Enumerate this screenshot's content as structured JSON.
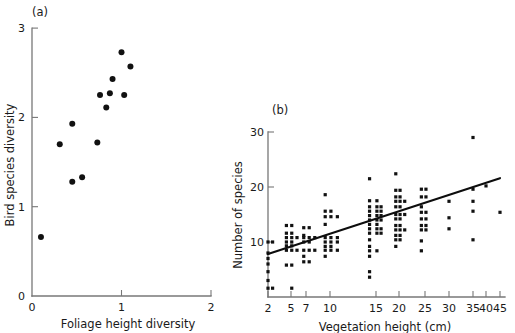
{
  "figure": {
    "panel_a_label": "(a)",
    "panel_b_label": "(b)"
  },
  "chart_data": [
    {
      "type": "scatter",
      "panel": "(a)",
      "title": "",
      "xlabel": "Foliage height diversity",
      "ylabel": "Bird species diversity",
      "xlim": [
        0,
        2
      ],
      "ylim": [
        0,
        3
      ],
      "xticks": [
        0,
        1,
        2
      ],
      "xticklabels": [
        "0",
        "1",
        "2"
      ],
      "yticks": [
        0,
        1,
        2,
        3
      ],
      "yticklabels": [
        "0",
        "1",
        "2",
        "3"
      ],
      "grid": false,
      "legend": false,
      "marker": "filled-circle",
      "points": [
        {
          "x": 0.1,
          "y": 0.66
        },
        {
          "x": 0.31,
          "y": 1.7
        },
        {
          "x": 0.45,
          "y": 1.28
        },
        {
          "x": 0.45,
          "y": 1.93
        },
        {
          "x": 0.56,
          "y": 1.33
        },
        {
          "x": 0.73,
          "y": 1.72
        },
        {
          "x": 0.76,
          "y": 2.25
        },
        {
          "x": 0.83,
          "y": 2.11
        },
        {
          "x": 0.87,
          "y": 2.27
        },
        {
          "x": 0.9,
          "y": 2.43
        },
        {
          "x": 1.0,
          "y": 2.73
        },
        {
          "x": 1.03,
          "y": 2.25
        },
        {
          "x": 1.1,
          "y": 2.57
        }
      ]
    },
    {
      "type": "scatter",
      "panel": "(b)",
      "title": "",
      "xlabel": "Vegetation height (cm)",
      "ylabel": "Number of species",
      "xlim": [
        1,
        46
      ],
      "ylim": [
        0,
        32
      ],
      "xticks": [
        2,
        5,
        7,
        10,
        15,
        20,
        25,
        30,
        35,
        40,
        45
      ],
      "xticklabels": [
        "2",
        "5",
        "7",
        "10",
        "15",
        "20",
        "25",
        "30",
        "35",
        "40",
        "45"
      ],
      "yticks": [
        10,
        20,
        30
      ],
      "yticklabels": [
        "10",
        "20",
        "30"
      ],
      "grid": false,
      "legend": false,
      "marker": "filled-square-small",
      "trendline": {
        "x1": 2,
        "y1": 7.8,
        "x2": 45,
        "y2": 21.6
      },
      "points": [
        {
          "x": 2,
          "y": 10
        },
        {
          "x": 2.6,
          "y": 10
        },
        {
          "x": 2,
          "y": 8
        },
        {
          "x": 2,
          "y": 7
        },
        {
          "x": 2,
          "y": 6
        },
        {
          "x": 2,
          "y": 4.6
        },
        {
          "x": 2,
          "y": 3
        },
        {
          "x": 2,
          "y": 1.6
        },
        {
          "x": 2.6,
          "y": 1.6
        },
        {
          "x": 4.4,
          "y": 13
        },
        {
          "x": 5.1,
          "y": 13
        },
        {
          "x": 4.4,
          "y": 11.6
        },
        {
          "x": 5.1,
          "y": 11.6
        },
        {
          "x": 4.4,
          "y": 10.8
        },
        {
          "x": 5.1,
          "y": 10.8
        },
        {
          "x": 5.8,
          "y": 10.8
        },
        {
          "x": 4.4,
          "y": 10
        },
        {
          "x": 5.1,
          "y": 10
        },
        {
          "x": 4.4,
          "y": 9.3
        },
        {
          "x": 5.1,
          "y": 9.3
        },
        {
          "x": 4.4,
          "y": 8.5
        },
        {
          "x": 5.1,
          "y": 8.5
        },
        {
          "x": 5.8,
          "y": 8.5
        },
        {
          "x": 4.4,
          "y": 5.8
        },
        {
          "x": 5.1,
          "y": 5.8
        },
        {
          "x": 5.1,
          "y": 1.6
        },
        {
          "x": 6.7,
          "y": 12.6
        },
        {
          "x": 7.4,
          "y": 12.6
        },
        {
          "x": 6.7,
          "y": 11.2
        },
        {
          "x": 6.7,
          "y": 10.8
        },
        {
          "x": 7.4,
          "y": 10.8
        },
        {
          "x": 8.1,
          "y": 10.8
        },
        {
          "x": 6.7,
          "y": 10
        },
        {
          "x": 7.4,
          "y": 10
        },
        {
          "x": 6.7,
          "y": 8.5
        },
        {
          "x": 7.4,
          "y": 8.5
        },
        {
          "x": 8.1,
          "y": 8.5
        },
        {
          "x": 6.7,
          "y": 7.4
        },
        {
          "x": 6.7,
          "y": 6.4
        },
        {
          "x": 7.4,
          "y": 6.4
        },
        {
          "x": 9.4,
          "y": 18.6
        },
        {
          "x": 9.4,
          "y": 15.6
        },
        {
          "x": 10.1,
          "y": 15.6
        },
        {
          "x": 9.4,
          "y": 14.6
        },
        {
          "x": 10.1,
          "y": 14.6
        },
        {
          "x": 10.8,
          "y": 14.6
        },
        {
          "x": 9.4,
          "y": 13.2
        },
        {
          "x": 9.4,
          "y": 10.8
        },
        {
          "x": 10.1,
          "y": 10.8
        },
        {
          "x": 10.8,
          "y": 10.8
        },
        {
          "x": 9.4,
          "y": 10
        },
        {
          "x": 10.1,
          "y": 10
        },
        {
          "x": 10.8,
          "y": 10
        },
        {
          "x": 9.4,
          "y": 9.2
        },
        {
          "x": 10.1,
          "y": 9.2
        },
        {
          "x": 9.4,
          "y": 8.5
        },
        {
          "x": 10.1,
          "y": 8.5
        },
        {
          "x": 10.8,
          "y": 8.5
        },
        {
          "x": 9.4,
          "y": 7.4
        },
        {
          "x": 14.3,
          "y": 21.5
        },
        {
          "x": 14.3,
          "y": 17.5
        },
        {
          "x": 15.2,
          "y": 17.5
        },
        {
          "x": 14.3,
          "y": 16.4
        },
        {
          "x": 15.2,
          "y": 16.4
        },
        {
          "x": 16.1,
          "y": 16.4
        },
        {
          "x": 14.3,
          "y": 15.6
        },
        {
          "x": 15.2,
          "y": 15.6
        },
        {
          "x": 16.1,
          "y": 15.6
        },
        {
          "x": 14.3,
          "y": 14.8
        },
        {
          "x": 15.2,
          "y": 14.8
        },
        {
          "x": 16.1,
          "y": 14.8
        },
        {
          "x": 14.3,
          "y": 14
        },
        {
          "x": 15.2,
          "y": 14
        },
        {
          "x": 16.1,
          "y": 14
        },
        {
          "x": 14.3,
          "y": 13.2
        },
        {
          "x": 15.2,
          "y": 13.2
        },
        {
          "x": 14.3,
          "y": 12.4
        },
        {
          "x": 15.2,
          "y": 12.4
        },
        {
          "x": 16.1,
          "y": 12.4
        },
        {
          "x": 14.3,
          "y": 11.6
        },
        {
          "x": 15.2,
          "y": 11.6
        },
        {
          "x": 16.1,
          "y": 11.6
        },
        {
          "x": 14.3,
          "y": 10.4
        },
        {
          "x": 14.3,
          "y": 9.2
        },
        {
          "x": 14.3,
          "y": 8.4
        },
        {
          "x": 15.2,
          "y": 8.4
        },
        {
          "x": 14.3,
          "y": 7.4
        },
        {
          "x": 14.3,
          "y": 4.6
        },
        {
          "x": 14.3,
          "y": 3.6
        },
        {
          "x": 19.3,
          "y": 22.4
        },
        {
          "x": 19.3,
          "y": 19.4
        },
        {
          "x": 20.2,
          "y": 19.4
        },
        {
          "x": 19.3,
          "y": 18.2
        },
        {
          "x": 20.2,
          "y": 18.2
        },
        {
          "x": 19.3,
          "y": 17.4
        },
        {
          "x": 20.2,
          "y": 17.4
        },
        {
          "x": 21.1,
          "y": 17.4
        },
        {
          "x": 19.3,
          "y": 16.4
        },
        {
          "x": 20.2,
          "y": 16.4
        },
        {
          "x": 19.3,
          "y": 15
        },
        {
          "x": 20.2,
          "y": 15
        },
        {
          "x": 21.1,
          "y": 15
        },
        {
          "x": 19.3,
          "y": 14.2
        },
        {
          "x": 20.2,
          "y": 14.2
        },
        {
          "x": 19.3,
          "y": 13
        },
        {
          "x": 20.2,
          "y": 13
        },
        {
          "x": 19.3,
          "y": 12.2
        },
        {
          "x": 20.2,
          "y": 12.2
        },
        {
          "x": 21.1,
          "y": 12.2
        },
        {
          "x": 19.3,
          "y": 11.2
        },
        {
          "x": 20.2,
          "y": 11.2
        },
        {
          "x": 19.3,
          "y": 10.4
        },
        {
          "x": 20.2,
          "y": 10.4
        },
        {
          "x": 19.3,
          "y": 9.2
        },
        {
          "x": 24.3,
          "y": 19.6
        },
        {
          "x": 25.2,
          "y": 19.6
        },
        {
          "x": 24.3,
          "y": 18.2
        },
        {
          "x": 25.2,
          "y": 18.2
        },
        {
          "x": 24.3,
          "y": 16.4
        },
        {
          "x": 24.3,
          "y": 15.4
        },
        {
          "x": 25.2,
          "y": 15.4
        },
        {
          "x": 24.3,
          "y": 14.2
        },
        {
          "x": 25.2,
          "y": 14.2
        },
        {
          "x": 24.3,
          "y": 13
        },
        {
          "x": 25.2,
          "y": 13
        },
        {
          "x": 24.3,
          "y": 12.2
        },
        {
          "x": 25.2,
          "y": 12.2
        },
        {
          "x": 24.3,
          "y": 10.2
        },
        {
          "x": 24.3,
          "y": 8.4
        },
        {
          "x": 30,
          "y": 17.4
        },
        {
          "x": 30,
          "y": 14.4
        },
        {
          "x": 30,
          "y": 12.4
        },
        {
          "x": 35,
          "y": 29
        },
        {
          "x": 35,
          "y": 19.6
        },
        {
          "x": 35,
          "y": 17.4
        },
        {
          "x": 35,
          "y": 15.6
        },
        {
          "x": 35,
          "y": 10.4
        },
        {
          "x": 40,
          "y": 20.2
        },
        {
          "x": 45,
          "y": 15.4
        }
      ]
    }
  ]
}
